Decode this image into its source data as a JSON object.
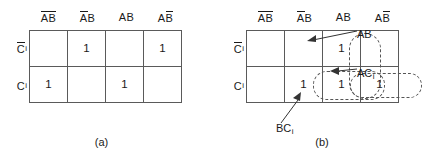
{
  "figure_a": {
    "caption": "(a)",
    "column_headers": [
      {
        "left": "A",
        "left_bar": true,
        "right": "B",
        "right_bar": true
      },
      {
        "left": "A",
        "left_bar": true,
        "right": "B",
        "right_bar": false
      },
      {
        "left": "A",
        "left_bar": false,
        "right": "B",
        "right_bar": false
      },
      {
        "left": "A",
        "left_bar": false,
        "right": "B",
        "right_bar": true
      }
    ],
    "row_labels": [
      {
        "base": "C",
        "bar": true,
        "sub": "i"
      },
      {
        "base": "C",
        "bar": false,
        "sub": "i"
      }
    ],
    "cells": [
      [
        "",
        "1",
        "",
        "1"
      ],
      [
        "1",
        "",
        "1",
        ""
      ]
    ]
  },
  "figure_b": {
    "caption": "(b)",
    "column_headers": [
      {
        "left": "A",
        "left_bar": true,
        "right": "B",
        "right_bar": true
      },
      {
        "left": "A",
        "left_bar": true,
        "right": "B",
        "right_bar": false
      },
      {
        "left": "A",
        "left_bar": false,
        "right": "B",
        "right_bar": false
      },
      {
        "left": "A",
        "left_bar": false,
        "right": "B",
        "right_bar": true
      }
    ],
    "row_labels": [
      {
        "base": "C",
        "bar": true,
        "sub": "i"
      },
      {
        "base": "C",
        "bar": false,
        "sub": "i"
      }
    ],
    "cells": [
      [
        "",
        "",
        "1",
        ""
      ],
      [
        "",
        "1",
        "1",
        "1"
      ]
    ],
    "groups": [
      {
        "id": "AB",
        "label_base": "AB",
        "label_sub": "",
        "cells": "AB column, both rows"
      },
      {
        "id": "BCi",
        "label_base": "BC",
        "label_sub": "i",
        "cells": "bottom row, columns 2-3"
      },
      {
        "id": "ACi",
        "label_base": "AC",
        "label_sub": "i",
        "cells": "bottom row, columns 3-4"
      }
    ]
  },
  "colors": {
    "grid_line": "#5a5a5a",
    "group_line": "#555555",
    "text": "#1a1a1a",
    "background": "#ffffff"
  }
}
